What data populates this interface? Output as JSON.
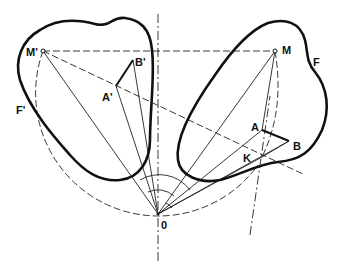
{
  "diagram": {
    "title": "",
    "labels": {
      "M_prime": "M'",
      "M": "M",
      "A_prime": "A'",
      "B_prime": "B'",
      "A": "A",
      "B": "B",
      "K": "K",
      "O": "0",
      "F": "F",
      "F_prime": "F'"
    },
    "colors": {
      "stroke": "#111111",
      "background": "#ffffff"
    }
  }
}
